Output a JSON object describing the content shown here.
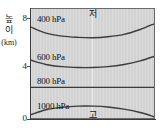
{
  "chart_data": {
    "type": "line",
    "title": "",
    "xlabel": "",
    "ylabel": "높이 (km)",
    "ylim": [
      0,
      9.2
    ],
    "xlim": [
      0,
      1
    ],
    "grid": false,
    "legend": "none",
    "y_ticks": [
      "0",
      "4",
      "8"
    ],
    "y_tick_values": [
      0,
      4,
      8
    ],
    "series": [
      {
        "name": "400 hPa",
        "label": "400 hPa",
        "x": [
          0.0,
          0.12,
          0.25,
          0.38,
          0.5,
          0.62,
          0.75,
          0.88,
          1.0
        ],
        "values": [
          7.7,
          7.2,
          6.95,
          6.85,
          6.82,
          6.9,
          7.1,
          7.5,
          8.0
        ]
      },
      {
        "name": "600 hPa",
        "label": "600 hPa",
        "x": [
          0.0,
          0.12,
          0.25,
          0.38,
          0.5,
          0.62,
          0.75,
          0.88,
          1.0
        ],
        "values": [
          4.95,
          4.6,
          4.42,
          4.35,
          4.35,
          4.42,
          4.6,
          4.9,
          5.3
        ]
      },
      {
        "name": "800 hPa",
        "label": "800 hPa",
        "x": [
          0.0,
          0.25,
          0.5,
          0.75,
          1.0
        ],
        "values": [
          2.7,
          2.7,
          2.7,
          2.7,
          2.7
        ]
      },
      {
        "name": "1000 hPa",
        "label": "1000 hPa",
        "x": [
          0.0,
          0.12,
          0.25,
          0.38,
          0.5,
          0.62,
          0.75,
          0.88,
          1.0
        ],
        "values": [
          0.45,
          0.85,
          1.05,
          1.15,
          1.15,
          1.08,
          0.9,
          0.62,
          0.25
        ]
      }
    ],
    "annotations": [
      {
        "name": "low-pressure",
        "text": "저",
        "x": 0.5,
        "y": 9.0
      },
      {
        "name": "high-pressure",
        "text": "고",
        "x": 0.5,
        "y": 0.25
      }
    ]
  },
  "axis": {
    "y_label_line1": "높",
    "y_label_line2": "이",
    "y_label_unit": "(km)",
    "ticks": {
      "top": "8",
      "mid": "4",
      "bottom": "0"
    }
  },
  "isobars": {
    "p400": "400 hPa",
    "p600": "600 hPa",
    "p800": "800 hPa",
    "p1000": "1000 hPa"
  },
  "markers": {
    "low": "저",
    "high": "고"
  },
  "colors": {
    "plot_background": "#d2d2d2",
    "isobar_line": "#3b3b3b",
    "axis": "#3a3a3a",
    "text": "#111111",
    "center_line": "#ffffff"
  }
}
